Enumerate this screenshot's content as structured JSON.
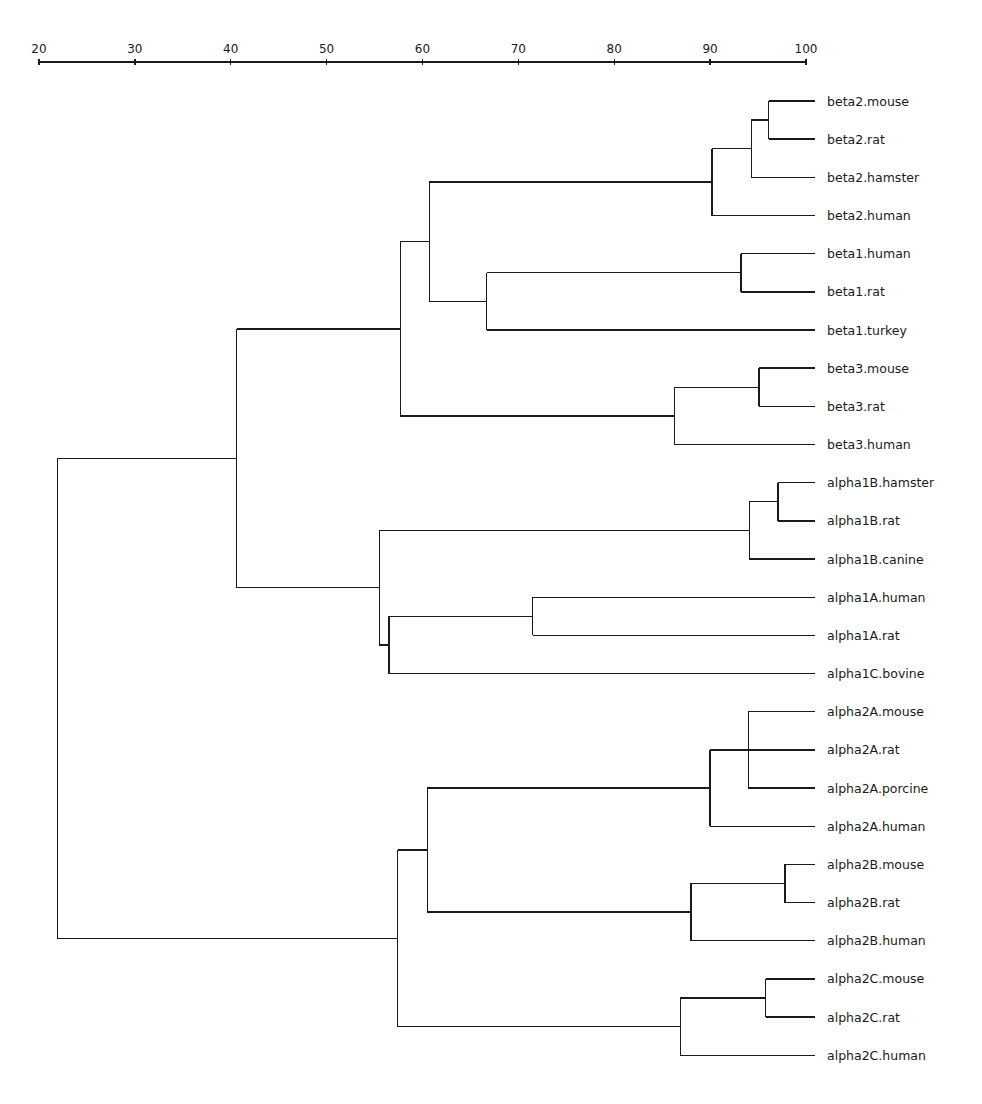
{
  "chart_data": {
    "type": "dendrogram",
    "title": "",
    "xlabel": "",
    "ylabel": "",
    "axis": {
      "position": "top",
      "range": [
        20,
        100
      ],
      "ticks": [
        20,
        30,
        40,
        50,
        60,
        70,
        80,
        90,
        100
      ]
    },
    "leaves": [
      "beta2.mouse",
      "beta2.rat",
      "beta2.hamster",
      "beta2.human",
      "beta1.human",
      "beta1.rat",
      "beta1.turkey",
      "beta3.mouse",
      "beta3.rat",
      "beta3.human",
      "alpha1B.hamster",
      "alpha1B.rat",
      "alpha1B.canine",
      "alpha1A.human",
      "alpha1A.rat",
      "alpha1C.bovine",
      "alpha2A.mouse",
      "alpha2A.rat",
      "alpha2A.porcine",
      "alpha2A.human",
      "alpha2B.mouse",
      "alpha2B.rat",
      "alpha2B.human",
      "alpha2C.mouse",
      "alpha2C.rat",
      "alpha2C.human"
    ],
    "tree": {
      "h": 21.9,
      "children": [
        {
          "h": 40.6,
          "children": [
            {
              "h": 57.7,
              "children": [
                {
                  "h": 60.7,
                  "children": [
                    {
                      "h": 90.2,
                      "children": [
                        {
                          "h": 94.3,
                          "children": [
                            {
                              "h": 96.1,
                              "children": [
                                {
                                  "leaf": "beta2.mouse"
                                },
                                {
                                  "leaf": "beta2.rat"
                                }
                              ]
                            },
                            {
                              "leaf": "beta2.hamster"
                            }
                          ]
                        },
                        {
                          "leaf": "beta2.human"
                        }
                      ]
                    },
                    {
                      "h": 66.7,
                      "children": [
                        {
                          "h": 93.2,
                          "children": [
                            {
                              "leaf": "beta1.human"
                            },
                            {
                              "leaf": "beta1.rat"
                            }
                          ]
                        },
                        {
                          "leaf": "beta1.turkey"
                        }
                      ]
                    }
                  ]
                },
                {
                  "h": 86.3,
                  "children": [
                    {
                      "h": 95.1,
                      "children": [
                        {
                          "leaf": "beta3.mouse"
                        },
                        {
                          "leaf": "beta3.rat"
                        }
                      ]
                    },
                    {
                      "leaf": "beta3.human"
                    }
                  ]
                }
              ]
            },
            {
              "h": 55.5,
              "children": [
                {
                  "h": 94.1,
                  "children": [
                    {
                      "h": 97.1,
                      "children": [
                        {
                          "leaf": "alpha1B.hamster"
                        },
                        {
                          "leaf": "alpha1B.rat"
                        }
                      ]
                    },
                    {
                      "leaf": "alpha1B.canine"
                    }
                  ]
                },
                {
                  "h": 56.5,
                  "children": [
                    {
                      "h": 71.5,
                      "children": [
                        {
                          "leaf": "alpha1A.human"
                        },
                        {
                          "leaf": "alpha1A.rat"
                        }
                      ]
                    },
                    {
                      "leaf": "alpha1C.bovine"
                    }
                  ]
                }
              ]
            }
          ]
        },
        {
          "h": 57.4,
          "children": [
            {
              "h": 60.5,
              "children": [
                {
                  "h": 90.0,
                  "children": [
                    {
                      "h": 94.0,
                      "children": [
                        {
                          "leaf": "alpha2A.mouse"
                        },
                        {
                          "leaf": "alpha2A.rat"
                        },
                        {
                          "leaf": "alpha2A.porcine"
                        }
                      ]
                    },
                    {
                      "leaf": "alpha2A.human"
                    }
                  ]
                },
                {
                  "h": 88.0,
                  "children": [
                    {
                      "h": 97.8,
                      "children": [
                        {
                          "leaf": "alpha2B.mouse"
                        },
                        {
                          "leaf": "alpha2B.rat"
                        }
                      ]
                    },
                    {
                      "leaf": "alpha2B.human"
                    }
                  ]
                }
              ]
            },
            {
              "h": 86.9,
              "children": [
                {
                  "h": 95.8,
                  "children": [
                    {
                      "leaf": "alpha2C.mouse"
                    },
                    {
                      "leaf": "alpha2C.rat"
                    }
                  ]
                },
                {
                  "leaf": "alpha2C.human"
                }
              ]
            }
          ]
        }
      ]
    },
    "colors": {
      "ink": "#1a1a1a",
      "background": "#ffffff"
    }
  }
}
